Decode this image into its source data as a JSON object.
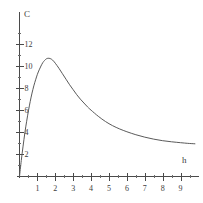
{
  "chart_data": {
    "type": "line",
    "title": "",
    "subtitle": "",
    "xlabel": "h",
    "ylabel": "C",
    "xlim": [
      0,
      10
    ],
    "ylim": [
      0,
      13
    ],
    "grid": false,
    "legend": null,
    "annotations": [],
    "x_ticks_major": [
      1,
      2,
      3,
      4,
      5,
      6,
      7,
      8,
      9
    ],
    "x_tick_labels": [
      "1",
      "2",
      "3",
      "4",
      "5",
      "6",
      "7",
      "8",
      "9"
    ],
    "x_ticks_minor": [
      0.5,
      1.5,
      2.5,
      3.5,
      4.5,
      5.5,
      6.5,
      7.5,
      8.5,
      9.5
    ],
    "y_ticks_major": [
      2,
      4,
      6,
      8,
      10,
      12
    ],
    "y_tick_labels": [
      "2",
      "4",
      "6",
      "8",
      "10",
      "12"
    ],
    "y_ticks_minor": [
      1,
      3,
      5,
      7,
      9,
      11,
      13
    ],
    "series": [
      {
        "name": "concentration",
        "color": "#5a5a5a",
        "x": [
          0.0,
          0.1,
          0.2,
          0.3,
          0.4,
          0.5,
          0.6,
          0.7,
          0.8,
          0.9,
          1.0,
          1.1,
          1.2,
          1.3,
          1.4,
          1.5,
          1.6,
          1.7,
          1.8,
          1.9,
          2.0,
          2.2,
          2.4,
          2.6,
          2.8,
          3.0,
          3.2,
          3.4,
          3.6,
          3.8,
          4.0,
          4.4,
          4.8,
          5.2,
          5.6,
          6.0,
          6.5,
          7.0,
          7.5,
          8.0,
          8.5,
          9.0,
          9.4,
          9.8
        ],
        "y": [
          0.0,
          1.45,
          2.75,
          3.95,
          5.0,
          5.95,
          6.8,
          7.55,
          8.2,
          8.75,
          9.25,
          9.65,
          10.0,
          10.3,
          10.5,
          10.65,
          10.7,
          10.68,
          10.6,
          10.45,
          10.25,
          9.8,
          9.3,
          8.8,
          8.3,
          7.85,
          7.4,
          7.0,
          6.65,
          6.3,
          6.0,
          5.45,
          4.98,
          4.6,
          4.3,
          4.05,
          3.78,
          3.56,
          3.38,
          3.24,
          3.14,
          3.06,
          3.0,
          2.96
        ]
      }
    ],
    "peak": {
      "x": 1.55,
      "y": 10.7
    },
    "origin_value": 0
  },
  "labels": {
    "y_axis_title": "C",
    "x_axis_title": "h"
  },
  "colors": {
    "curve": "#5a5a5a",
    "axis": "#4a4a4a",
    "text": "#3d3d3d",
    "background": "#ffffff"
  }
}
